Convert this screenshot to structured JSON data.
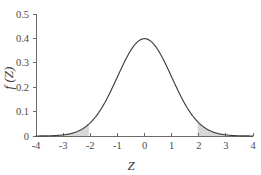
{
  "chart_data": {
    "type": "line",
    "title": "",
    "subtitle": "",
    "xlabel": "Z",
    "ylabel": "f (Z)",
    "xlim": [
      -4,
      4
    ],
    "ylim": [
      0,
      0.5
    ],
    "x_ticks": [
      -4,
      -3,
      -2,
      -1,
      0,
      1,
      2,
      3,
      4
    ],
    "x_tick_labels": [
      "-4",
      "-3",
      "-2",
      "-1",
      "0",
      "1",
      "2",
      "3",
      "4"
    ],
    "y_ticks": [
      0,
      0.1,
      0.2,
      0.3,
      0.4,
      0.5
    ],
    "y_tick_labels": [
      "0",
      "0.1",
      "0.2",
      "0.3",
      "0.4",
      "0.5"
    ],
    "grid": false,
    "legend": null,
    "legend_position": "none",
    "curve_color": "#3f3f3f",
    "shade_color": "#d8d8d8",
    "axis_color": "#6b6b6b",
    "series": [
      {
        "name": "standard normal density",
        "distribution": "normal",
        "mean": 0,
        "sd": 1,
        "peak_value": 0.3989,
        "x": [
          -4,
          -3.75,
          -3.5,
          -3.25,
          -3,
          -2.75,
          -2.5,
          -2.25,
          -2,
          -1.75,
          -1.5,
          -1.25,
          -1,
          -0.75,
          -0.5,
          -0.25,
          0,
          0.25,
          0.5,
          0.75,
          1,
          1.25,
          1.5,
          1.75,
          2,
          2.25,
          2.5,
          2.75,
          3,
          3.25,
          3.5,
          3.75,
          4
        ],
        "values": [
          0.0001,
          0.0004,
          0.0009,
          0.002,
          0.0044,
          0.0091,
          0.0175,
          0.0317,
          0.054,
          0.0863,
          0.1295,
          0.1826,
          0.242,
          0.3011,
          0.3521,
          0.3867,
          0.3989,
          0.3867,
          0.3521,
          0.3011,
          0.242,
          0.1826,
          0.1295,
          0.0863,
          0.054,
          0.0317,
          0.0175,
          0.0091,
          0.0044,
          0.002,
          0.0009,
          0.0004,
          0.0001
        ]
      }
    ],
    "shaded_regions": [
      {
        "name": "left-tail",
        "x_from": -3.05,
        "x_to": -2.05,
        "color": "#d8d8d8"
      },
      {
        "name": "right-tail",
        "x_from": 1.96,
        "x_to": 3.0,
        "color": "#d8d8d8"
      }
    ],
    "annotations": []
  },
  "axes": {
    "x_title": "Z",
    "y_title": "f (Z)"
  }
}
